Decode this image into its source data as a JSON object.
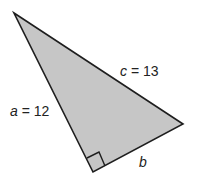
{
  "diagram": {
    "type": "right-triangle",
    "fill_color": "#c6c6c6",
    "stroke_color": "#1e1e1e",
    "vertices": {
      "top": [
        14,
        13
      ],
      "right": [
        183,
        124
      ],
      "right_angle": [
        93,
        172
      ]
    },
    "right_angle_marker": true,
    "labels": {
      "hypotenuse": {
        "var": "c",
        "eq": " = 13"
      },
      "side_a": {
        "var": "a",
        "eq": " = 12"
      },
      "side_b": {
        "var": "b"
      }
    }
  }
}
